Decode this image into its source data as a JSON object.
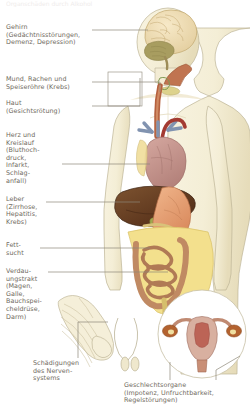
{
  "diagram": {
    "type": "anatomical-illustration",
    "language": "de",
    "subject": "Organschäden durch Alkohol",
    "figure": "menschlicher Körper mit inneren Organen",
    "top_cut_text": "Organschäden durch Alkohol"
  },
  "colors": {
    "background": "#ffffff",
    "skin": "#f6f0d9",
    "skin_shade": "#ece3c4",
    "outline": "#b9b193",
    "text": "#6f6a5e",
    "leader_line": "#8e8878",
    "brain": "#efdcb4",
    "cerebellum": "#a59a5e",
    "esophagus": "#b5613f",
    "heart": "#c99a94",
    "artery": "#a33a32",
    "vein": "#8193b0",
    "liver": "#6b4326",
    "stomach": "#e6a173",
    "intestine": "#c08a63",
    "fat": "#f2e08a",
    "uterus": "#c8a08e",
    "ovary": "#b3622f",
    "inset_fill": "#ffffff"
  },
  "labels": [
    {
      "id": "brain",
      "name": "label-brain",
      "text": "Gehirn\n(Gedächtnisstörungen,\nDemenz, Depression)",
      "x": 6,
      "y": 24,
      "organ": "Gehirn",
      "conditions": [
        "Gedächtnisstörungen",
        "Demenz",
        "Depression"
      ]
    },
    {
      "id": "mouth-throat-esophagus",
      "name": "label-mouth-throat-esophagus",
      "text": "Mund, Rachen und\nSpeiseröhre (Krebs)",
      "x": 6,
      "y": 76,
      "organ": "Mund, Rachen und Speiseröhre",
      "conditions": [
        "Krebs"
      ]
    },
    {
      "id": "skin",
      "name": "label-skin",
      "text": "Haut\n(Gesichtsrötung)",
      "x": 6,
      "y": 100,
      "organ": "Haut",
      "conditions": [
        "Gesichtsrötung"
      ]
    },
    {
      "id": "heart-circulation",
      "name": "label-heart-circulation",
      "text": "Herz und\nKreislauf\n(Bluthoch-\ndruck,\nInfarkt,\nSchlag-\nanfall)",
      "x": 6,
      "y": 132,
      "organ": "Herz und Kreislauf",
      "conditions": [
        "Bluthochdruck",
        "Infarkt",
        "Schlaganfall"
      ]
    },
    {
      "id": "liver",
      "name": "label-liver",
      "text": "Leber\n(Zirrhose,\nHepatitis,\nKrebs)",
      "x": 6,
      "y": 196,
      "organ": "Leber",
      "conditions": [
        "Zirrhose",
        "Hepatitis",
        "Krebs"
      ]
    },
    {
      "id": "obesity",
      "name": "label-obesity",
      "text": "Fett-\nsucht",
      "x": 6,
      "y": 242,
      "organ": "Fettsucht",
      "conditions": []
    },
    {
      "id": "digestive-tract",
      "name": "label-digestive-tract",
      "text": "Verdau-\nungstrakt\n(Magen,\nGalle,\nBauchspei-\ncheldrüse,\nDarm)",
      "x": 6,
      "y": 268,
      "organ": "Verdauungstrakt",
      "conditions": [
        "Magen",
        "Galle",
        "Bauchspeicheldrüse",
        "Darm"
      ]
    },
    {
      "id": "nervous-system",
      "name": "label-nervous-system",
      "text": "Schädigungen\ndes Nerven-\nsystems",
      "x": 33,
      "y": 360,
      "organ": "Nervensystem",
      "conditions": [
        "Schädigungen"
      ]
    },
    {
      "id": "sex-organs",
      "name": "label-sex-organs",
      "text": "Geschlechtsorgane\n(Impotenz, Unfruchtbarkeit,\nRegelstörungen)",
      "x": 124,
      "y": 382,
      "organ": "Geschlechtsorgane",
      "conditions": [
        "Impotenz",
        "Unfruchtbarkeit",
        "Regelstörungen"
      ]
    }
  ]
}
